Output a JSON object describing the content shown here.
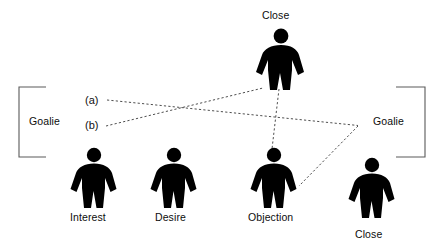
{
  "diagram": {
    "title_text": "",
    "background_color": "#ffffff",
    "figure_color": "#000000",
    "line_color": "#4a4a4a",
    "brackets": [
      {
        "id": "left-goalie",
        "label": "Goalie",
        "side": "left"
      },
      {
        "id": "right-goalie",
        "label": "Goalie",
        "side": "right"
      }
    ],
    "figures": [
      {
        "id": "top-close",
        "label": "Close",
        "x": 262,
        "y": 28,
        "w": 38,
        "h": 62,
        "label_x": 263,
        "label_y": 10
      },
      {
        "id": "interest",
        "label": "Interest",
        "x": 75,
        "y": 148,
        "w": 37,
        "h": 60,
        "label_x": 71,
        "label_y": 211
      },
      {
        "id": "desire",
        "label": "Desire",
        "x": 155,
        "y": 148,
        "w": 37,
        "h": 60,
        "label_x": 155,
        "label_y": 211
      },
      {
        "id": "objection",
        "label": "Objection",
        "x": 255,
        "y": 148,
        "w": 37,
        "h": 60,
        "label_x": 249,
        "label_y": 211
      },
      {
        "id": "bottom-close",
        "label": "Close",
        "x": 353,
        "y": 158,
        "w": 37,
        "h": 60,
        "label_x": 355,
        "label_y": 228
      }
    ],
    "connector_labels": [
      {
        "id": "a",
        "text": "(a)",
        "x": 85,
        "y": 94
      },
      {
        "id": "b",
        "text": "(b)",
        "x": 85,
        "y": 119
      }
    ],
    "connectors": [
      {
        "id": "line-a",
        "from": "(a)",
        "to": "right-goalie-apex",
        "points": "107,100 358,125"
      },
      {
        "id": "line-b",
        "from": "(b)",
        "to": "top-close",
        "points": "107,126 263,88"
      },
      {
        "id": "line-close-objection",
        "from": "top-close",
        "to": "objection",
        "points": "279,89 272,148"
      },
      {
        "id": "line-apex-objection",
        "from": "right-goalie-apex",
        "to": "objection",
        "points": "358,126 299,186"
      }
    ]
  }
}
